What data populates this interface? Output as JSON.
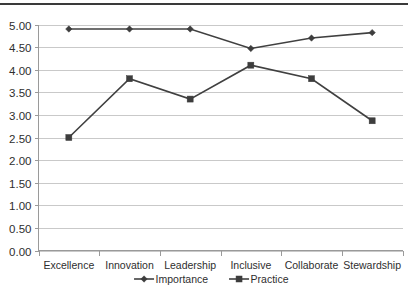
{
  "chart_data": {
    "type": "line",
    "title": "",
    "subtitle": "",
    "xlabel": "",
    "ylabel": "",
    "categories": [
      "Excellence",
      "Innovation",
      "Leadership",
      "Inclusive",
      "Collaborate",
      "Stewardship"
    ],
    "series": [
      {
        "name": "Importance",
        "marker": "diamond",
        "color": "#404040",
        "values": [
          4.9,
          4.9,
          4.9,
          4.47,
          4.7,
          4.82
        ]
      },
      {
        "name": "Practice",
        "marker": "square",
        "color": "#404040",
        "values": [
          2.5,
          3.8,
          3.35,
          4.1,
          3.8,
          2.87
        ]
      }
    ],
    "ylim": [
      0,
      5
    ],
    "ytick_step": 0.5,
    "ytick_labels": [
      "5.00",
      "4.50",
      "4.00",
      "3.50",
      "3.00",
      "2.50",
      "2.00",
      "1.50",
      "1.00",
      "0.50",
      "0.00"
    ],
    "ytick_values": [
      5.0,
      4.5,
      4.0,
      3.5,
      3.0,
      2.5,
      2.0,
      1.5,
      1.0,
      0.5,
      0.0
    ],
    "grid": true,
    "grid_axis": "y",
    "legend_position": "bottom",
    "legend_entries": [
      "Importance",
      "Practice"
    ]
  }
}
